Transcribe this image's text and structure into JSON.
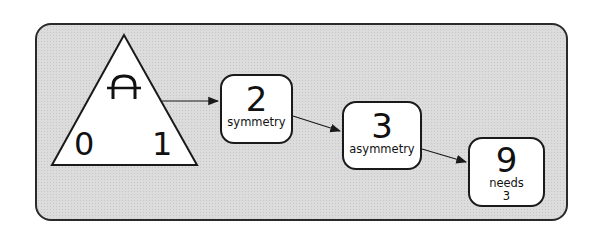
{
  "diagram": {
    "root": {
      "shape": "triangle",
      "symbol": "A",
      "left_label": "0",
      "right_label": "1"
    },
    "nodes": [
      {
        "id": "n2",
        "value": "2",
        "label": "symmetry"
      },
      {
        "id": "n3",
        "value": "3",
        "label": "asymmetry"
      },
      {
        "id": "n9",
        "value": "9",
        "label_line1": "needs",
        "label_line2": "3"
      }
    ],
    "edges": [
      {
        "from": "root",
        "to": "n2"
      },
      {
        "from": "n2",
        "to": "n3"
      },
      {
        "from": "n3",
        "to": "n9"
      }
    ],
    "colors": {
      "background": "#dcdcdc",
      "stroke": "#1a1a1a",
      "node_fill": "#ffffff"
    }
  }
}
